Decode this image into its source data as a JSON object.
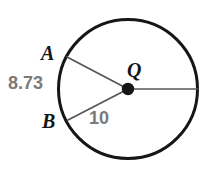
{
  "figure": {
    "kind": "circle-geometry-diagram",
    "background_color": "#ffffff",
    "stroke_color": "#161616",
    "line_color": "#555555",
    "label_color_point": "#161616",
    "label_color_measure": "#7b7b7b",
    "circle": {
      "center_label": "Q",
      "center_x": 128,
      "center_y": 89,
      "radius": 70,
      "stroke_width": 3
    },
    "center_dot": {
      "radius": 6
    },
    "points": [
      {
        "name": "A",
        "label": "A",
        "x": 67,
        "y": 57,
        "label_x": 41,
        "label_y": 43
      },
      {
        "name": "B",
        "label": "B",
        "x": 68,
        "y": 120,
        "label_x": 42,
        "label_y": 111
      },
      {
        "name": "R",
        "label": "",
        "x": 198,
        "y": 89,
        "label_x": 0,
        "label_y": 0
      }
    ],
    "segments": [
      {
        "name": "radius-QA",
        "from": "Q",
        "to": "A",
        "x1": 128,
        "y1": 89,
        "x2": 67,
        "y2": 57,
        "width": 1.6
      },
      {
        "name": "radius-QB",
        "from": "Q",
        "to": "B",
        "x1": 128,
        "y1": 89,
        "x2": 68,
        "y2": 120,
        "width": 1.6
      },
      {
        "name": "radius-QR",
        "from": "Q",
        "to": "R",
        "x1": 128,
        "y1": 89,
        "x2": 198,
        "y2": 89,
        "width": 1.6
      }
    ],
    "measures": {
      "chord_AB": "8.73",
      "radius": "10"
    }
  }
}
